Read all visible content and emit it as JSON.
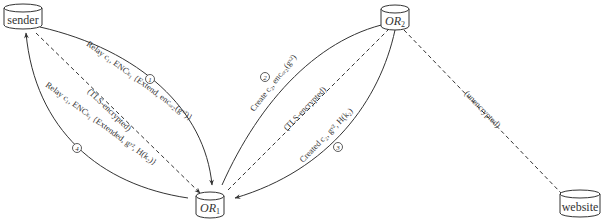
{
  "diagram": {
    "type": "onion-routing circuit extension",
    "nodes": {
      "sender": {
        "label": "sender"
      },
      "or1": {
        "label": "OR",
        "subscript": "1"
      },
      "or2": {
        "label": "OR",
        "subscript": "2"
      },
      "website": {
        "label": "website"
      }
    },
    "edges": {
      "step1": {
        "number": "1",
        "from": "sender",
        "to": "OR1",
        "label": "Relay c₁, ENCₖ₁ {Extend, encₒᵣ₂(gˣ²)}",
        "style": "solid"
      },
      "step2": {
        "number": "2",
        "from": "OR1",
        "to": "OR2",
        "label": "Create c₂, encₒᵣ₂(gˣ²)",
        "style": "solid"
      },
      "step3": {
        "number": "3",
        "from": "OR2",
        "to": "OR1",
        "label": "Created c₂, gʸ², H(k₂)",
        "style": "solid"
      },
      "step4": {
        "number": "4",
        "from": "OR1",
        "to": "sender",
        "label": "Relay c₁, ENCₖ₁ {Extended, gʸ², H(k₂)}",
        "style": "solid"
      },
      "tls_sender_or1": {
        "from": "sender",
        "to": "OR1",
        "label": "(TLS-encrypted)",
        "style": "dashed"
      },
      "tls_or1_or2": {
        "from": "OR1",
        "to": "OR2",
        "label": "(TLS-encrypted)",
        "style": "dashed"
      },
      "unenc_or2_website": {
        "from": "OR2",
        "to": "website",
        "label": "(unencrypted)",
        "style": "dashed"
      }
    }
  }
}
